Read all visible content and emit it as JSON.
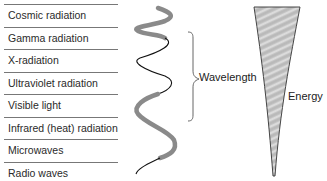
{
  "spectrum": {
    "bands": [
      {
        "label": "Cosmic radiation"
      },
      {
        "label": "Gamma radiation"
      },
      {
        "label": "X-radiation"
      },
      {
        "label": "Ultraviolet radiation"
      },
      {
        "label": "Visible light"
      },
      {
        "label": "Infrared (heat) radiation"
      },
      {
        "label": "Microwaves"
      },
      {
        "label": "Radio waves"
      }
    ]
  },
  "wave": {
    "label": "Wavelength",
    "thick_color": "#8a8a8a",
    "thin_color": "#111111"
  },
  "energy": {
    "label": "Energy",
    "fill_color": "#bdbdbd"
  }
}
